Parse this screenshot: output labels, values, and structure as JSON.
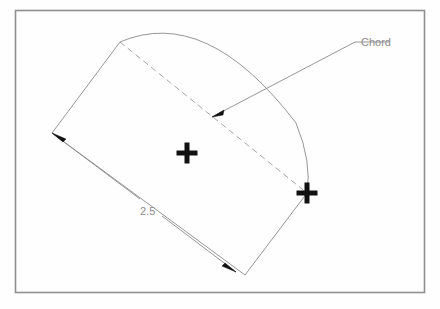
{
  "document": {
    "type": "technical-drawing",
    "background_color": "#fefefe",
    "border_color": "#8f8f92",
    "line_color": "#8a8a8d",
    "dashed_color": "#9a9a9d",
    "marker_color": "#111111",
    "text_color": "#8d8d8d"
  },
  "frame": {
    "name": "drawing-border",
    "x": 15,
    "y": 10,
    "width": 410,
    "height": 283
  },
  "labels": {
    "chord_label": "Chord",
    "dimension_value": "2.5"
  },
  "annotations": {
    "leader": {
      "name": "chord-leader-line",
      "arrow_point": "212,117",
      "elbow_point": "355,42",
      "text_anchor": "392,42"
    },
    "dimension": {
      "name": "length-dimension",
      "start": "52,133",
      "end": "236,272",
      "text_position": "149,211"
    }
  },
  "markers": [
    {
      "name": "center-cross",
      "x": 187,
      "y": 153,
      "size": 21,
      "thickness": 5
    },
    {
      "name": "chord-endpoint-cross",
      "x": 307,
      "y": 193,
      "size": 21,
      "thickness": 5
    }
  ],
  "geometry": {
    "shape_name": "arc-segment-outline",
    "vertices": {
      "top_left": "120,42",
      "left": "52,133",
      "bottom": "245,275",
      "right": "307,193"
    },
    "arc": {
      "name": "circular-arc",
      "start": "120,42",
      "end": "307,193",
      "apex": "200,28"
    },
    "chord": {
      "name": "chord-dashed-line",
      "start": "120,42",
      "end": "307,193"
    }
  },
  "chart_data": {
    "type": "diagram",
    "elements": [
      {
        "kind": "border-rectangle",
        "x": 15,
        "y": 10,
        "w": 410,
        "h": 283
      },
      {
        "kind": "polyline-outline",
        "points": "120,42 52,133 245,275 307,193"
      },
      {
        "kind": "arc",
        "from": "120,42",
        "to": "307,193",
        "bulge_apex": "200,28"
      },
      {
        "kind": "dashed-chord",
        "from": "120,42",
        "to": "307,193",
        "label": "Chord"
      },
      {
        "kind": "linear-dimension",
        "from": "52,133",
        "to": "236,272",
        "value": "2.5"
      },
      {
        "kind": "cross-marker",
        "at": "187,153"
      },
      {
        "kind": "cross-marker",
        "at": "307,193"
      }
    ],
    "annotations": [
      "Chord",
      "2.5"
    ]
  }
}
